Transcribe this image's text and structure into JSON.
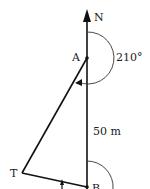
{
  "diagram": {
    "points": {
      "north": "N",
      "a": "A",
      "b": "B",
      "t": "T"
    },
    "angle_label": "210°",
    "distance_label": "50 m"
  }
}
